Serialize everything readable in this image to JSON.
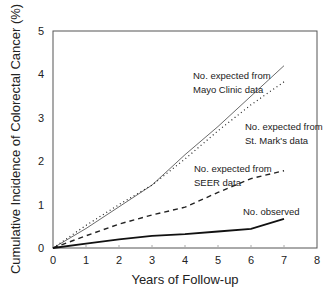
{
  "chart_data": {
    "type": "line",
    "title": "",
    "xlabel": "Years of Follow-up",
    "ylabel": "Cumulative Incidence of Colorectal Cancer (%)",
    "xlim": [
      0,
      8
    ],
    "ylim": [
      0,
      5
    ],
    "x_ticks": [
      "0",
      "1",
      "2",
      "3",
      "4",
      "5",
      "6",
      "7",
      "8"
    ],
    "y_ticks": [
      "0",
      "1",
      "2",
      "3",
      "4",
      "5"
    ],
    "grid": false,
    "legend_position": "inline annotations",
    "series": [
      {
        "name": "No. expected from Mayo Clinic data",
        "style": "solid-thin",
        "x": [
          0,
          1,
          2,
          3,
          4,
          5,
          6,
          7
        ],
        "values": [
          0,
          0.45,
          0.95,
          1.45,
          2.15,
          2.8,
          3.5,
          4.2
        ]
      },
      {
        "name": "No. expected from St. Mark's data",
        "style": "dotted",
        "x": [
          0,
          1,
          2,
          3,
          4,
          5,
          6,
          7
        ],
        "values": [
          0,
          0.52,
          1.0,
          1.45,
          2.05,
          2.7,
          3.3,
          3.83
        ]
      },
      {
        "name": "No. expected from SEER data",
        "style": "dashed",
        "x": [
          0,
          1,
          2,
          3,
          4,
          5,
          6,
          7
        ],
        "values": [
          0,
          0.28,
          0.55,
          0.76,
          0.94,
          1.28,
          1.6,
          1.78
        ]
      },
      {
        "name": "No. observed",
        "style": "solid-thick",
        "x": [
          0,
          1,
          2,
          3,
          4,
          5,
          6,
          7
        ],
        "values": [
          0,
          0.1,
          0.2,
          0.28,
          0.32,
          0.38,
          0.44,
          0.67
        ]
      }
    ],
    "annotations": [
      {
        "lines": [
          "No. expected from",
          "Mayo Clinic data"
        ],
        "x": 193,
        "y": 79
      },
      {
        "lines": [
          "No. expected from",
          "St. Mark's data"
        ],
        "x": 245,
        "y": 130
      },
      {
        "lines": [
          "No. expected from",
          "SEER data"
        ],
        "x": 194,
        "y": 172
      },
      {
        "lines": [
          "No. observed"
        ],
        "x": 243,
        "y": 215
      }
    ]
  }
}
